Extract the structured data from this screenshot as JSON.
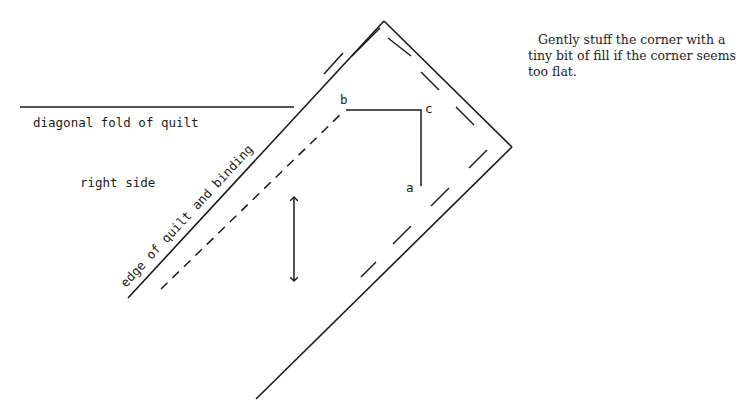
{
  "instruction": {
    "text": "Gently stuff the corner with a tiny bit of fill if the corner seems too flat."
  },
  "labels": {
    "fold": "diagonal fold of quilt",
    "side": "right side",
    "edge": "edge of quilt and binding",
    "point_a": "a",
    "point_b": "b",
    "point_c": "c"
  },
  "colors": {
    "ink": "#1a1a1a",
    "background": "#ffffff"
  }
}
